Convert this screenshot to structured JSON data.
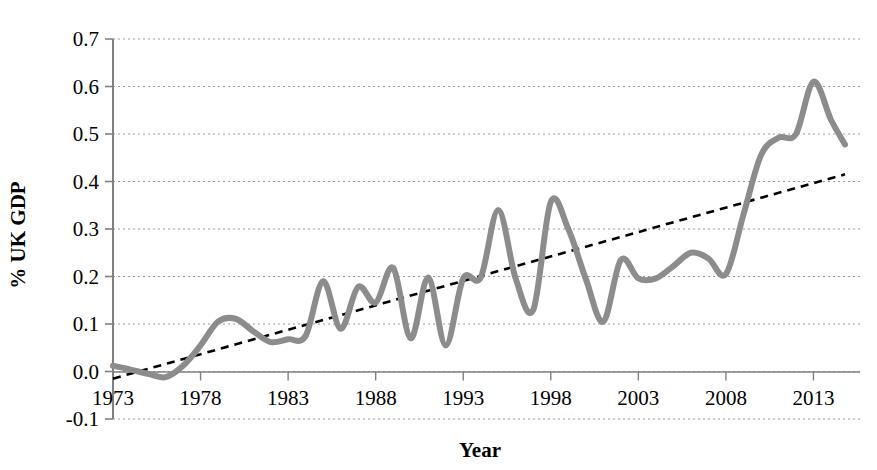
{
  "chart_data": {
    "type": "line",
    "title": "",
    "xlabel": "Year",
    "ylabel": "% UK GDP",
    "xlim": [
      1973,
      2014.8
    ],
    "ylim": [
      -0.1,
      0.7
    ],
    "xticks": [
      1973,
      1978,
      1983,
      1988,
      1993,
      1998,
      2003,
      2008,
      2013
    ],
    "xtick_labels": [
      "1973",
      "1978",
      "1983",
      "1988",
      "1993",
      "1998",
      "2003",
      "2008",
      "2013"
    ],
    "yticks": [
      -0.1,
      0.0,
      0.1,
      0.2,
      0.3,
      0.4,
      0.5,
      0.6,
      0.7
    ],
    "ytick_labels": [
      "-0.1",
      "0.0",
      "0.1",
      "0.2",
      "0.3",
      "0.4",
      "0.5",
      "0.6",
      "0.7"
    ],
    "grid": "horizontal-dotted",
    "legend": "none",
    "series": [
      {
        "name": "% UK GDP",
        "style": "solid-thick-grey",
        "color": "#8c8c8c",
        "x": [
          1973,
          1974,
          1975,
          1976,
          1977,
          1978,
          1979,
          1980,
          1981,
          1982,
          1983,
          1984,
          1985,
          1986,
          1987,
          1988,
          1989,
          1990,
          1991,
          1992,
          1993,
          1994,
          1995,
          1996,
          1997,
          1998,
          1999,
          2000,
          2001,
          2002,
          2003,
          2004,
          2005,
          2006,
          2007,
          2008,
          2009,
          2010,
          2011,
          2012,
          2013,
          2014,
          2014.8
        ],
        "y": [
          0.012,
          0.004,
          -0.005,
          -0.012,
          0.012,
          0.055,
          0.105,
          0.111,
          0.085,
          0.062,
          0.068,
          0.075,
          0.19,
          0.09,
          0.178,
          0.145,
          0.218,
          0.07,
          0.198,
          0.055,
          0.196,
          0.198,
          0.34,
          0.195,
          0.13,
          0.357,
          0.3,
          0.195,
          0.105,
          0.235,
          0.196,
          0.196,
          0.222,
          0.25,
          0.238,
          0.205,
          0.33,
          0.455,
          0.492,
          0.5,
          0.61,
          0.53,
          0.478
        ]
      },
      {
        "name": "Linear trend",
        "style": "dashed-black",
        "color": "#000000",
        "x": [
          1973,
          2014.8
        ],
        "y": [
          -0.015,
          0.415
        ]
      }
    ]
  },
  "axes": {
    "y_title": "% UK GDP",
    "x_title": "Year"
  }
}
